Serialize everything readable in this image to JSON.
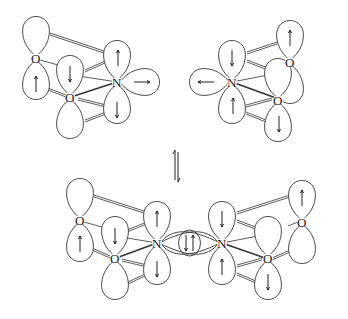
{
  "equilibrium_symbol": "⇌",
  "molecules": {
    "top_left": {
      "atoms": [
        {
          "label": "O"
        },
        {
          "label": "O"
        },
        {
          "label": "N"
        }
      ]
    },
    "top_right": {
      "atoms": [
        {
          "label": "N"
        },
        {
          "label": "O"
        },
        {
          "label": "O"
        }
      ]
    },
    "bottom_dimer": {
      "atoms": [
        {
          "label": "O"
        },
        {
          "label": "O"
        },
        {
          "label": "N"
        },
        {
          "label": "N"
        },
        {
          "label": "O"
        },
        {
          "label": "O"
        }
      ],
      "central_bond_electrons": "↓↑"
    }
  },
  "colors": {
    "line": "#333333",
    "background": "#ffffff"
  }
}
